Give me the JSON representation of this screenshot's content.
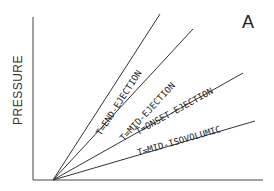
{
  "figure": {
    "panel_label": "A",
    "y_axis_label": "PRESSURE",
    "x_axis_label": "",
    "lines": [
      {
        "label": "T=END-EJECTION"
      },
      {
        "label": "T=MID-EJECTION"
      },
      {
        "label": "T=ONSET-EJECTION"
      },
      {
        "label": "T=MID-ISOVOLUMIC"
      }
    ]
  },
  "colors": {
    "line": "#333333",
    "background": "#ffffff"
  }
}
